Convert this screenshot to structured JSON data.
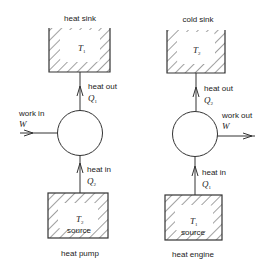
{
  "diagrams": [
    {
      "caption": "heat pump",
      "top_reservoir": {
        "label": "heat sink",
        "temperature": "T",
        "temp_sub": "1"
      },
      "top_flow": {
        "label": "heat out",
        "quantity": "Q",
        "quantity_sub": "1"
      },
      "work": {
        "label": "work in",
        "quantity": "W",
        "direction": "in"
      },
      "bottom_flow": {
        "label": "heat in",
        "quantity": "Q",
        "quantity_sub": "2"
      },
      "bottom_reservoir": {
        "label": "source",
        "temperature": "T",
        "temp_sub": "2"
      }
    },
    {
      "caption": "heat engine",
      "top_reservoir": {
        "label": "cold sink",
        "temperature": "T",
        "temp_sub": "2"
      },
      "top_flow": {
        "label": "heat out",
        "quantity": "Q",
        "quantity_sub": "2"
      },
      "work": {
        "label": "work out",
        "quantity": "W",
        "direction": "out"
      },
      "bottom_flow": {
        "label": "heat in",
        "quantity": "Q",
        "quantity_sub": "1"
      },
      "bottom_reservoir": {
        "label": "source",
        "temperature": "T",
        "temp_sub": "1"
      }
    }
  ],
  "colors": {
    "ink": "#333333",
    "background": "#ffffff"
  }
}
